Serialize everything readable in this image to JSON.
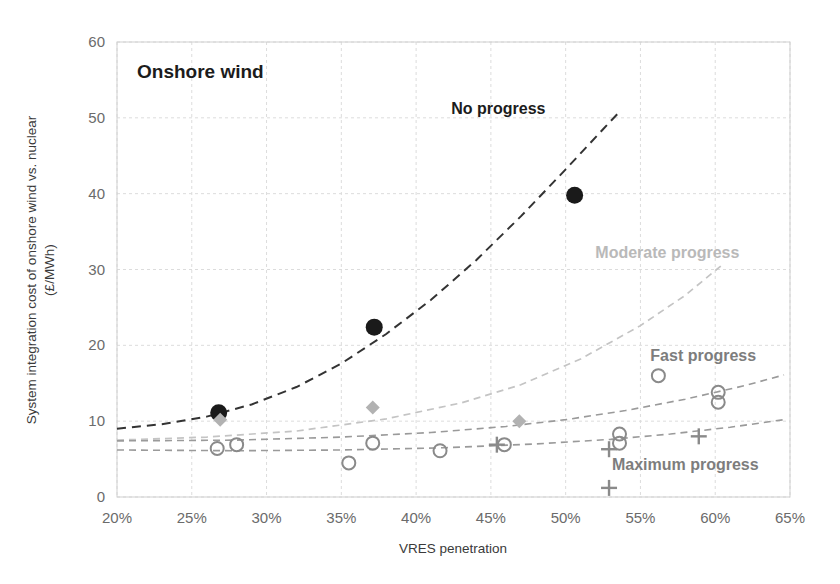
{
  "chart_data": {
    "type": "scatter",
    "title": "Onshore wind",
    "xlabel": "VRES penetration",
    "ylabel": "System integration cost of onshore wind vs. nuclear (£/MWh)",
    "ylabel_line1": "System integration cost of onshore wind vs. nuclear",
    "ylabel_line2": "(£/MWh)",
    "xlim": [
      20,
      65
    ],
    "ylim": [
      0,
      60
    ],
    "xticks": [
      "20%",
      "25%",
      "30%",
      "35%",
      "40%",
      "45%",
      "50%",
      "55%",
      "60%",
      "65%"
    ],
    "xtick_values": [
      20,
      25,
      30,
      35,
      40,
      45,
      50,
      55,
      60,
      65
    ],
    "yticks": [
      "0",
      "10",
      "20",
      "30",
      "40",
      "50",
      "60"
    ],
    "ytick_values": [
      0,
      10,
      20,
      30,
      40,
      50,
      60
    ],
    "grid": true,
    "legend": "annotations-inline",
    "annotations": [
      {
        "text": "No progress",
        "x": 45.5,
        "y": 50.5,
        "style": "dark"
      },
      {
        "text": "Moderate progress",
        "x": 56.8,
        "y": 31.5,
        "style": "light"
      },
      {
        "text": "Fast progress",
        "x": 59.2,
        "y": 18.0,
        "style": "mid"
      },
      {
        "text": "Maximum progress",
        "x": 58.0,
        "y": 3.6,
        "style": "mid"
      }
    ],
    "series": [
      {
        "name": "No progress",
        "marker": "filled-circle",
        "color": "#1a1a1a",
        "points": [
          {
            "x": 26.8,
            "y": 11.1
          },
          {
            "x": 37.2,
            "y": 22.4
          },
          {
            "x": 50.6,
            "y": 39.8
          }
        ]
      },
      {
        "name": "Moderate progress",
        "marker": "diamond",
        "color": "#b2b2b2",
        "points": [
          {
            "x": 26.9,
            "y": 10.2
          },
          {
            "x": 37.1,
            "y": 11.8
          },
          {
            "x": 46.9,
            "y": 10.0
          }
        ]
      },
      {
        "name": "Fast progress",
        "marker": "open-circle",
        "color": "#8a8a8a",
        "points": [
          {
            "x": 26.7,
            "y": 6.4
          },
          {
            "x": 28.0,
            "y": 6.9
          },
          {
            "x": 35.5,
            "y": 4.5
          },
          {
            "x": 37.1,
            "y": 7.1
          },
          {
            "x": 41.6,
            "y": 6.1
          },
          {
            "x": 45.9,
            "y": 6.9
          },
          {
            "x": 53.6,
            "y": 8.3
          },
          {
            "x": 53.6,
            "y": 7.1
          },
          {
            "x": 56.2,
            "y": 16.0
          },
          {
            "x": 60.2,
            "y": 13.8
          },
          {
            "x": 60.2,
            "y": 12.5
          }
        ]
      },
      {
        "name": "Maximum progress",
        "marker": "plus",
        "color": "#8a8a8a",
        "points": [
          {
            "x": 45.4,
            "y": 6.9
          },
          {
            "x": 52.9,
            "y": 6.3
          },
          {
            "x": 52.9,
            "y": 1.2
          },
          {
            "x": 58.9,
            "y": 8.0
          }
        ]
      }
    ],
    "trendlines": [
      {
        "name": "No progress",
        "color": "#333333",
        "dash": "9 6",
        "width": 2.0,
        "points": [
          {
            "x": 20,
            "y": 9.0
          },
          {
            "x": 23,
            "y": 9.6
          },
          {
            "x": 26,
            "y": 10.6
          },
          {
            "x": 29,
            "y": 12.2
          },
          {
            "x": 32,
            "y": 14.5
          },
          {
            "x": 35,
            "y": 17.6
          },
          {
            "x": 38,
            "y": 21.5
          },
          {
            "x": 41,
            "y": 26.0
          },
          {
            "x": 44,
            "y": 31.2
          },
          {
            "x": 47,
            "y": 37.0
          },
          {
            "x": 50,
            "y": 43.2
          },
          {
            "x": 52.5,
            "y": 48.5
          },
          {
            "x": 53.6,
            "y": 50.8
          }
        ]
      },
      {
        "name": "Moderate progress",
        "color": "#c4c4c4",
        "dash": "7 5",
        "width": 1.7,
        "points": [
          {
            "x": 20,
            "y": 7.5
          },
          {
            "x": 26,
            "y": 7.9
          },
          {
            "x": 32,
            "y": 8.7
          },
          {
            "x": 38,
            "y": 10.3
          },
          {
            "x": 43,
            "y": 12.4
          },
          {
            "x": 47,
            "y": 14.8
          },
          {
            "x": 51,
            "y": 18.2
          },
          {
            "x": 55,
            "y": 22.6
          },
          {
            "x": 58,
            "y": 26.6
          },
          {
            "x": 60.4,
            "y": 30.5
          }
        ]
      },
      {
        "name": "Fast progress",
        "color": "#9a9a9a",
        "dash": "7 5",
        "width": 1.6,
        "points": [
          {
            "x": 20,
            "y": 7.4
          },
          {
            "x": 28,
            "y": 7.5
          },
          {
            "x": 35,
            "y": 7.9
          },
          {
            "x": 41,
            "y": 8.5
          },
          {
            "x": 46,
            "y": 9.3
          },
          {
            "x": 50,
            "y": 10.2
          },
          {
            "x": 54,
            "y": 11.4
          },
          {
            "x": 58,
            "y": 12.9
          },
          {
            "x": 62,
            "y": 14.7
          },
          {
            "x": 64.6,
            "y": 16.1
          }
        ]
      },
      {
        "name": "Maximum progress",
        "color": "#9a9a9a",
        "dash": "7 5",
        "width": 1.6,
        "points": [
          {
            "x": 20,
            "y": 6.2
          },
          {
            "x": 28,
            "y": 6.1
          },
          {
            "x": 35,
            "y": 6.2
          },
          {
            "x": 42,
            "y": 6.5
          },
          {
            "x": 48,
            "y": 7.0
          },
          {
            "x": 53,
            "y": 7.6
          },
          {
            "x": 57,
            "y": 8.3
          },
          {
            "x": 61,
            "y": 9.2
          },
          {
            "x": 64.6,
            "y": 10.2
          }
        ]
      }
    ]
  }
}
